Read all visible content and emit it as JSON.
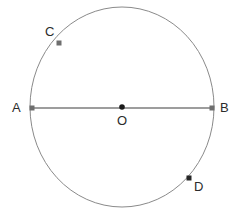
{
  "figure": {
    "type": "geometry-diagram",
    "background_color": "#ffffff",
    "canvas": {
      "width": 245,
      "height": 215
    },
    "circle": {
      "name": "circle-outline",
      "center": {
        "x": 122,
        "y": 107
      },
      "radius_x": 92,
      "radius_y": 100,
      "stroke_color": "#8a8a8a",
      "stroke_width": 1,
      "fill": "none"
    },
    "segments": [
      {
        "name": "diameter-AB",
        "from": "A",
        "to": "B",
        "x1": 32,
        "y1": 108,
        "x2": 212,
        "y2": 108,
        "stroke_color": "#7d7d7d",
        "stroke_width": 1.4
      }
    ],
    "points": [
      {
        "id": "A",
        "label": "A",
        "x": 32,
        "y": 108,
        "marker_color": "#6e6e6e",
        "marker_size": 5,
        "marker_shape": "square",
        "label_x": 12,
        "label_y": 101
      },
      {
        "id": "B",
        "label": "B",
        "x": 212,
        "y": 108,
        "marker_color": "#6e6e6e",
        "marker_size": 5,
        "marker_shape": "square",
        "label_x": 220,
        "label_y": 101
      },
      {
        "id": "O",
        "label": "O",
        "x": 122,
        "y": 107,
        "marker_color": "#1a1a1a",
        "marker_size": 5,
        "marker_shape": "circle",
        "label_x": 117,
        "label_y": 114
      },
      {
        "id": "C",
        "label": "C",
        "x": 59,
        "y": 43,
        "marker_color": "#6e6e6e",
        "marker_size": 5,
        "marker_shape": "square",
        "label_x": 45,
        "label_y": 25
      },
      {
        "id": "D",
        "label": "D",
        "x": 189,
        "y": 178,
        "marker_color": "#262626",
        "marker_size": 5,
        "marker_shape": "square",
        "label_x": 194,
        "label_y": 180
      }
    ]
  }
}
